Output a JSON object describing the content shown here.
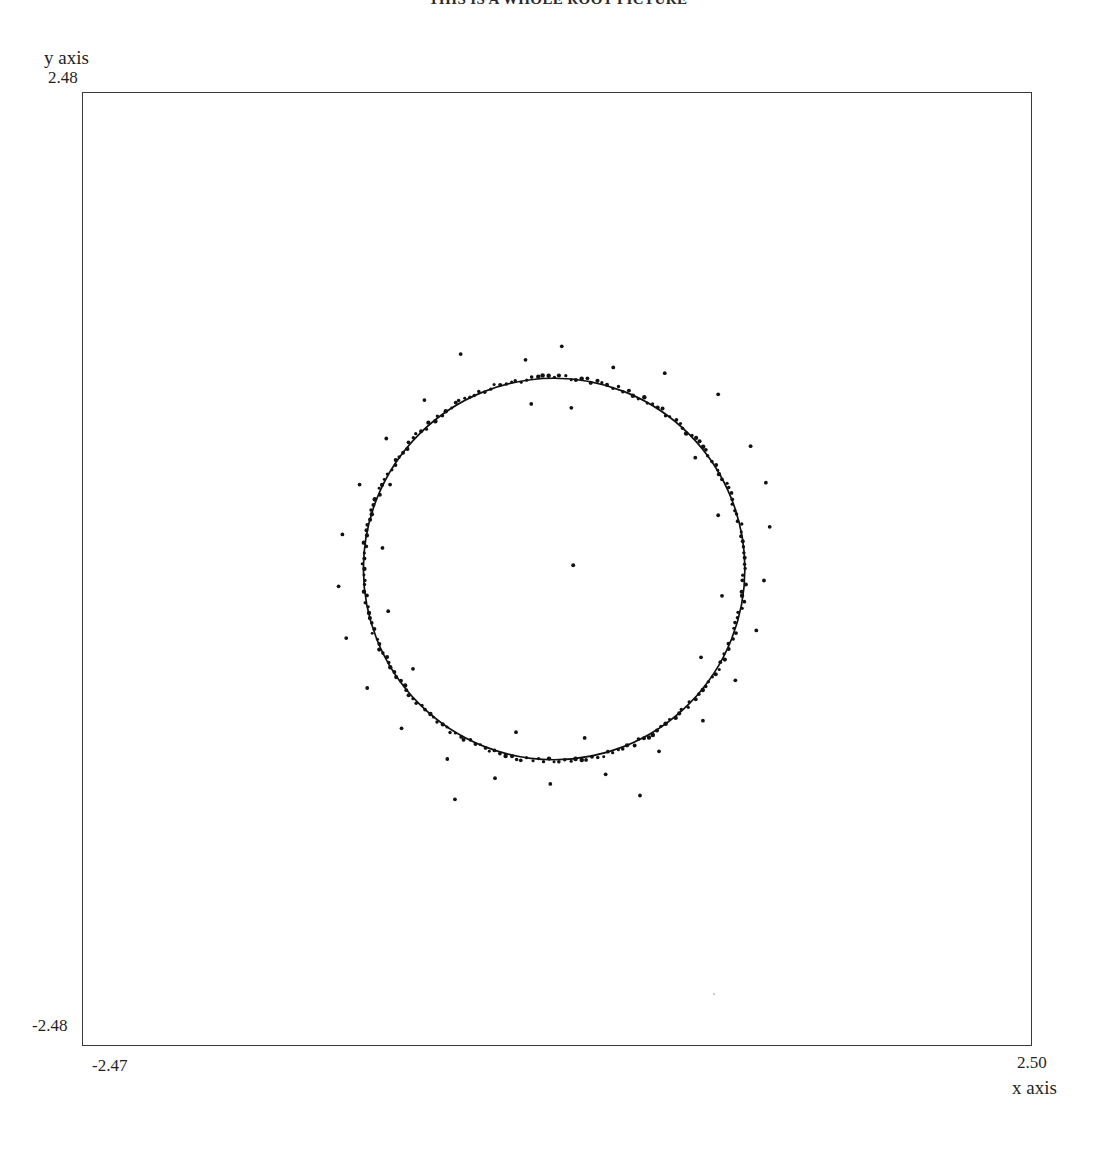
{
  "title": "THIS IS A WHOLE ROOT PICTURE",
  "axes": {
    "y_label": "y axis",
    "y_max_tick": "2.48",
    "y_min_tick": "-2.48",
    "x_label": "x axis",
    "x_min_tick": "-2.47",
    "x_max_tick": "2.50"
  },
  "chart_data": {
    "type": "scatter",
    "title": "THIS IS A WHOLE ROOT PICTURE",
    "xlabel": "x axis",
    "ylabel": "y axis",
    "xlim": [
      -2.47,
      2.5
    ],
    "ylim": [
      -2.48,
      2.48
    ],
    "grid": false,
    "legend": null,
    "marker": {
      "shape": "dot",
      "size_px": 2,
      "color": "#111111"
    },
    "ring": {
      "center": [
        0.0,
        0.0
      ],
      "radius": 1.0,
      "count": 220,
      "radial_jitter": 0.012,
      "note": "Points densely and nearly uniformly distributed in angle around the circle, forming a near-continuous curve."
    },
    "center_point": [
      0.1,
      0.02
    ],
    "outliers": [
      [
        -0.49,
        1.12
      ],
      [
        -0.15,
        1.09
      ],
      [
        0.04,
        1.16
      ],
      [
        0.31,
        1.05
      ],
      [
        0.58,
        1.02
      ],
      [
        0.86,
        0.91
      ],
      [
        1.03,
        0.64
      ],
      [
        1.11,
        0.45
      ],
      [
        1.13,
        0.22
      ],
      [
        1.1,
        -0.06
      ],
      [
        1.06,
        -0.32
      ],
      [
        0.95,
        -0.58
      ],
      [
        0.78,
        -0.79
      ],
      [
        0.55,
        -0.95
      ],
      [
        0.27,
        -1.07
      ],
      [
        -0.02,
        -1.12
      ],
      [
        -0.31,
        -1.09
      ],
      [
        -0.56,
        -0.99
      ],
      [
        -0.8,
        -0.83
      ],
      [
        -0.98,
        -0.62
      ],
      [
        -1.09,
        -0.36
      ],
      [
        -1.13,
        -0.09
      ],
      [
        -1.11,
        0.18
      ],
      [
        -1.02,
        0.44
      ],
      [
        -0.88,
        0.68
      ],
      [
        -0.68,
        0.88
      ],
      [
        -0.86,
        0.44
      ],
      [
        -0.9,
        0.11
      ],
      [
        -0.87,
        -0.22
      ],
      [
        -0.74,
        -0.52
      ],
      [
        0.74,
        0.58
      ],
      [
        0.86,
        0.28
      ],
      [
        0.88,
        -0.14
      ],
      [
        0.77,
        -0.46
      ],
      [
        0.09,
        0.84
      ],
      [
        -0.12,
        0.86
      ],
      [
        0.16,
        -0.88
      ],
      [
        -0.2,
        -0.85
      ],
      [
        0.45,
        -1.18
      ],
      [
        -0.52,
        -1.2
      ]
    ],
    "axis_tick_values": {
      "x": [
        -2.47,
        2.5
      ],
      "y": [
        -2.48,
        2.48
      ]
    }
  }
}
